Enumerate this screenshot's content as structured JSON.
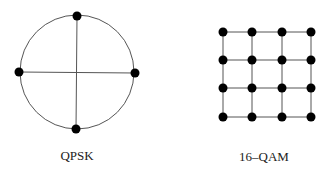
{
  "diagrams": [
    {
      "id": "qpsk",
      "label": "QPSK",
      "type": "circular-constellation",
      "center": [
        77,
        72
      ],
      "radius": 57,
      "points": [
        [
          77,
          16
        ],
        [
          135,
          73
        ],
        [
          76,
          129
        ],
        [
          19,
          72
        ]
      ]
    },
    {
      "id": "qam16",
      "label": "16–QAM",
      "type": "grid-constellation",
      "columns": [
        223,
        252,
        282,
        311
      ],
      "rows": [
        32,
        60,
        88,
        117
      ]
    }
  ],
  "colors": {
    "line": "#555555",
    "dot": "#000000",
    "text": "#222222"
  }
}
